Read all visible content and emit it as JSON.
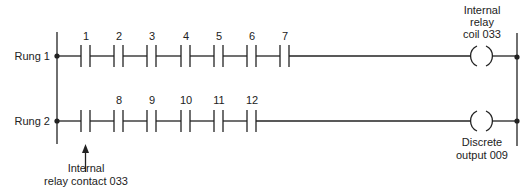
{
  "diagram": {
    "type": "ladder-logic",
    "rungs": [
      {
        "label": "Rung 1",
        "contacts": [
          {
            "label": "1",
            "type": "normally-open"
          },
          {
            "label": "2",
            "type": "normally-open"
          },
          {
            "label": "3",
            "type": "normally-open"
          },
          {
            "label": "4",
            "type": "normally-open"
          },
          {
            "label": "5",
            "type": "normally-open"
          },
          {
            "label": "6",
            "type": "normally-open"
          },
          {
            "label": "7",
            "type": "normally-open"
          }
        ],
        "coil": {
          "label_lines": [
            "Internal",
            "relay",
            "coil 033"
          ],
          "position": "above"
        }
      },
      {
        "label": "Rung 2",
        "contacts": [
          {
            "label": "",
            "type": "normally-open"
          },
          {
            "label": "8",
            "type": "normally-open"
          },
          {
            "label": "9",
            "type": "normally-open"
          },
          {
            "label": "10",
            "type": "normally-open"
          },
          {
            "label": "11",
            "type": "normally-open"
          },
          {
            "label": "12",
            "type": "normally-open"
          }
        ],
        "coil": {
          "label_lines": [
            "Discrete",
            "output 009"
          ],
          "position": "below"
        }
      }
    ],
    "annotations": [
      {
        "target": "rung2-contact-0",
        "label_lines": [
          "Internal",
          "relay contact 033"
        ]
      }
    ],
    "colors": {
      "line": "#222222",
      "background": "#ffffff"
    }
  }
}
